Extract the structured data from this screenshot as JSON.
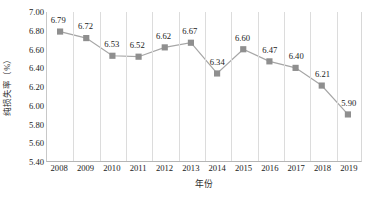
{
  "chart_data": {
    "type": "line",
    "title": "",
    "subtitle": "",
    "xlabel": "年份",
    "ylabel": "纯损失率（%）",
    "categories": [
      "2008",
      "2009",
      "2010",
      "2011",
      "2012",
      "2013",
      "2014",
      "2015",
      "2016",
      "2017",
      "2018",
      "2019"
    ],
    "values": [
      6.79,
      6.72,
      6.53,
      6.52,
      6.62,
      6.67,
      6.34,
      6.6,
      6.47,
      6.4,
      6.21,
      5.9
    ],
    "point_labels": [
      "6.79",
      "6.72",
      "6.53",
      "6.52",
      "6.62",
      "6.67",
      "6.34",
      "6.60",
      "6.47",
      "6.40",
      "6.21",
      "5.90"
    ],
    "ylim": [
      5.4,
      7.0
    ],
    "ytick_step": 0.2,
    "ytick_labels": [
      "7.00",
      "6.80",
      "6.60",
      "6.40",
      "6.20",
      "6.00",
      "5.80",
      "5.60",
      "5.40"
    ],
    "ytick_values": [
      7.0,
      6.8,
      6.6,
      6.4,
      6.2,
      6.0,
      5.8,
      5.6,
      5.4
    ],
    "grid": {
      "vertical": true,
      "horizontal": false
    },
    "legend": {
      "show": false,
      "position": "none",
      "entries": []
    },
    "series": [
      {
        "name": "纯损失率",
        "marker": "square",
        "line_color": "#a6a6a6",
        "marker_color": "#8f8f8f",
        "values": [
          6.79,
          6.72,
          6.53,
          6.52,
          6.62,
          6.67,
          6.34,
          6.6,
          6.47,
          6.4,
          6.21,
          5.9
        ]
      }
    ],
    "colors": {
      "line": "#a6a6a6",
      "marker": "#8f8f8f",
      "grid": "#dcdcdc",
      "axis": "#b5b5b5",
      "text": "#1a1a1a",
      "background": "#ffffff"
    }
  }
}
